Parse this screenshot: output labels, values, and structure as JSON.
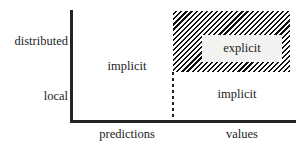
{
  "chart_data": {
    "type": "table",
    "title": "",
    "xlabel": "",
    "ylabel": "",
    "x_categories": [
      "predictions",
      "values"
    ],
    "y_categories": [
      "local",
      "distributed"
    ],
    "cells": [
      {
        "x": "predictions",
        "y": "distributed",
        "label": "implicit",
        "highlighted": false
      },
      {
        "x": "predictions",
        "y": "local",
        "label": "implicit",
        "highlighted": false
      },
      {
        "x": "values",
        "y": "distributed",
        "label": "explicit",
        "highlighted": true
      },
      {
        "x": "values",
        "y": "local",
        "label": "implicit",
        "highlighted": false
      }
    ],
    "highlight_style": "diagonal-hatch",
    "grid": false,
    "legend": "none",
    "divider": "dashed-vertical-between-predictions-and-values"
  },
  "axes": {
    "y_ticks": [
      {
        "label": "distributed"
      },
      {
        "label": "local"
      }
    ],
    "x_ticks": [
      {
        "label": "predictions"
      },
      {
        "label": "values"
      }
    ]
  },
  "regions": {
    "implicit_predictions": "implicit",
    "explicit_values_distributed": "explicit",
    "implicit_values_local": "implicit"
  },
  "colors": {
    "axis": "#242424",
    "text": "#1d1d1d",
    "hatch": "#111111",
    "background": "#ffffff",
    "label_box": "#f2f2f0"
  }
}
